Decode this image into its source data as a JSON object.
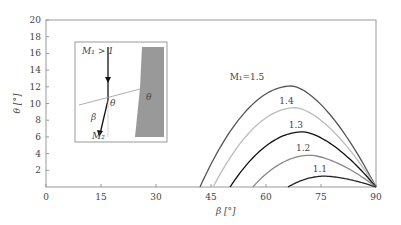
{
  "chart_data": {
    "type": "line",
    "title": "",
    "xlabel": "β [°]",
    "ylabel": "θ [°]",
    "xlim": [
      0,
      90
    ],
    "ylim": [
      0,
      20
    ],
    "xticks": [
      0,
      15,
      30,
      45,
      60,
      75,
      90
    ],
    "yticks": [
      2,
      4,
      6,
      8,
      10,
      12,
      14,
      16,
      18,
      20
    ],
    "grid": false,
    "legend": "inline labels on curves",
    "series": [
      {
        "name": "M1=1.5",
        "label": "M₁=1.5",
        "color": "#555555",
        "beta_start": 42,
        "beta_peak": 67,
        "theta_peak": 12.1,
        "beta_end": 90
      },
      {
        "name": "1.4",
        "label": "1.4",
        "color": "#bbbbbb",
        "beta_start": 45.6,
        "beta_peak": 68,
        "theta_peak": 9.5,
        "beta_end": 90
      },
      {
        "name": "1.3",
        "label": "1.3",
        "color": "#111111",
        "beta_start": 50.2,
        "beta_peak": 70,
        "theta_peak": 6.6,
        "beta_end": 90
      },
      {
        "name": "1.2",
        "label": "1.2",
        "color": "#888888",
        "beta_start": 56.4,
        "beta_peak": 72,
        "theta_peak": 3.8,
        "beta_end": 90
      },
      {
        "name": "1.1",
        "label": "1.1",
        "color": "#222222",
        "beta_start": 66,
        "beta_peak": 76,
        "theta_peak": 1.3,
        "beta_end": 90
      }
    ],
    "inset": {
      "labels": {
        "upstream": "M₁ > 1",
        "downstream": "M₂",
        "beta": "β",
        "theta_flow": "θ",
        "theta_wall": "θ"
      }
    }
  }
}
